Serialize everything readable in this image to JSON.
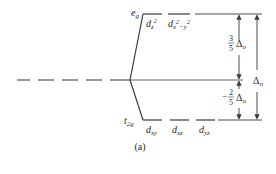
{
  "diagram": {
    "caption": "(a)",
    "colors": {
      "line": "#3a3a3a",
      "text": "#2a2a2a",
      "background": "#ffffff"
    },
    "levels": {
      "degenerate": {
        "label": "",
        "style": "dashed"
      },
      "eg": {
        "label": "e",
        "label_sub": "g",
        "orbitals": [
          {
            "name": "d",
            "sub": "z",
            "sup": "2"
          },
          {
            "name": "d",
            "sub": "x",
            "sup": "2",
            "sub2": "−y",
            "sup2": "2"
          }
        ]
      },
      "t2g": {
        "label": "t",
        "label_sub": "2g",
        "orbitals": [
          {
            "name": "d",
            "sub": "xy"
          },
          {
            "name": "d",
            "sub": "xz"
          },
          {
            "name": "d",
            "sub": "yz"
          }
        ]
      }
    },
    "energy_annotations": {
      "upper": {
        "numerator": "3",
        "denominator": "5",
        "symbol": "Δ",
        "sub": "o",
        "sign": ""
      },
      "lower": {
        "numerator": "2",
        "denominator": "5",
        "symbol": "Δ",
        "sub": "o",
        "sign": "−"
      },
      "total": {
        "symbol": "Δ",
        "sub": "o"
      }
    }
  }
}
